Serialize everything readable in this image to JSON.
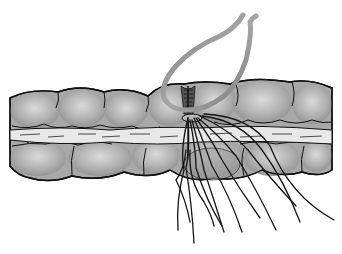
{
  "figure": {
    "description": "Illustration of a bowel (colon) segment with haustral folds, a central mesenteric band, a gathered suture line at mid-segment, a grey loop (tape) passing around it, and multiple loose suture tails hanging below.",
    "colors": {
      "background": "#ffffff",
      "bowel_fill": "#a9a9a9",
      "bowel_highlight": "#d8d8d8",
      "band_fill": "#e6e6e6",
      "outline": "#111111",
      "loop": "#8c8c8c",
      "suture": "#151515"
    },
    "elements": {
      "bowel": "bowel-segment",
      "band": "mesenteric-band",
      "loop": "vessel-loop",
      "sutures": "suture-tails",
      "gather": "purse-string-gather"
    }
  }
}
